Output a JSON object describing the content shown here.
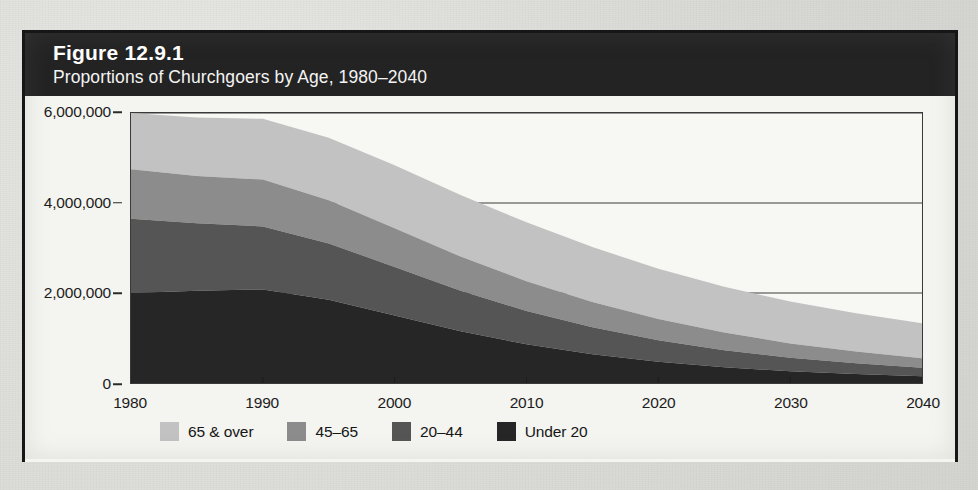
{
  "figure": {
    "number_label": "Figure 12.9.1",
    "subtitle": "Proportions of Churchgoers by Age, 1980–2040"
  },
  "legend": {
    "position": "bottom",
    "items": [
      {
        "label": "65 & over",
        "color": "#c2c2c2"
      },
      {
        "label": "45–65",
        "color": "#8c8c8c"
      },
      {
        "label": "20–44",
        "color": "#555555"
      },
      {
        "label": "Under 20",
        "color": "#262626"
      }
    ]
  },
  "axes": {
    "y_tick_labels": [
      "6,000,000",
      "4,000,000",
      "2,000,000",
      "0"
    ],
    "x_tick_labels": [
      "1980",
      "1990",
      "2000",
      "2010",
      "2020",
      "2030",
      "2040"
    ]
  },
  "chart_data": {
    "type": "area",
    "stacked": true,
    "title": "Proportions of Churchgoers by Age, 1980–2040",
    "xlabel": "",
    "ylabel": "",
    "xlim": [
      1980,
      2040
    ],
    "ylim": [
      0,
      6000000
    ],
    "yticks": [
      0,
      2000000,
      4000000,
      6000000
    ],
    "ytick_labels": [
      "0",
      "2,000,000",
      "4,000,000",
      "6,000,000"
    ],
    "xticks": [
      1980,
      1990,
      2000,
      2010,
      2020,
      2030,
      2040
    ],
    "xtick_labels": [
      "1980",
      "1990",
      "2000",
      "2010",
      "2020",
      "2030",
      "2040"
    ],
    "grid": true,
    "legend_position": "bottom",
    "x": [
      1980,
      1985,
      1990,
      1995,
      2000,
      2005,
      2010,
      2015,
      2020,
      2025,
      2030,
      2035,
      2040
    ],
    "series": [
      {
        "name": "Under 20",
        "color": "#262626",
        "values": [
          2000000,
          2050000,
          2080000,
          1850000,
          1500000,
          1150000,
          860000,
          640000,
          470000,
          350000,
          260000,
          200000,
          150000
        ]
      },
      {
        "name": "20–44",
        "color": "#555555",
        "values": [
          1650000,
          1500000,
          1400000,
          1250000,
          1080000,
          900000,
          740000,
          600000,
          480000,
          380000,
          300000,
          240000,
          190000
        ]
      },
      {
        "name": "45–65",
        "color": "#8c8c8c",
        "values": [
          1100000,
          1050000,
          1040000,
          960000,
          860000,
          760000,
          660000,
          560000,
          470000,
          390000,
          320000,
          260000,
          210000
        ]
      },
      {
        "name": "65 & over",
        "color": "#c2c2c2",
        "values": [
          1250000,
          1300000,
          1350000,
          1390000,
          1400000,
          1370000,
          1310000,
          1220000,
          1120000,
          1020000,
          930000,
          850000,
          780000
        ]
      }
    ],
    "totals": [
      6000000,
      5900000,
      5870000,
      5450000,
      4840000,
      4180000,
      3570000,
      3020000,
      2540000,
      2140000,
      1810000,
      1550000,
      1330000
    ],
    "colors": {
      "band_65_over": "#c2c2c2",
      "band_45_65": "#8c8c8c",
      "band_20_44": "#555555",
      "band_under_20": "#262626",
      "header_background": "#232323",
      "header_text": "#ffffff",
      "plot_background": "#f7f7f3",
      "frame": "#3a3a3a"
    }
  }
}
